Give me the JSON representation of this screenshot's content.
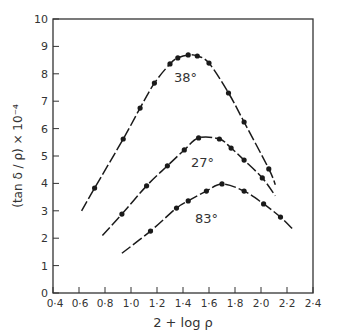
{
  "chart_data": {
    "type": "line",
    "title": "",
    "xlabel": "2 + log ρ",
    "ylabel": "(tan δ / ρ) × 10⁻⁴",
    "xlim": [
      0.4,
      2.4
    ],
    "ylim": [
      0,
      10
    ],
    "grid": false,
    "legend": "none (curves labeled inline)",
    "x_ticks": [
      "0·4",
      "0·6",
      "0·8",
      "1·0",
      "1·2",
      "1·4",
      "1·6",
      "1·8",
      "2·0",
      "2·2",
      "2·4"
    ],
    "y_ticks": [
      "0",
      "1",
      "2",
      "3",
      "4",
      "5",
      "6",
      "7",
      "8",
      "9",
      "10"
    ],
    "series": [
      {
        "name": "38°",
        "label_pos": [
          1.42,
          7.7
        ],
        "line_start": [
          0.62,
          3.0
        ],
        "line_end": [
          2.11,
          3.95
        ],
        "points": [
          [
            0.72,
            3.83
          ],
          [
            0.94,
            5.62
          ],
          [
            1.07,
            6.75
          ],
          [
            1.18,
            7.66
          ],
          [
            1.3,
            8.36
          ],
          [
            1.36,
            8.58
          ],
          [
            1.44,
            8.69
          ],
          [
            1.51,
            8.65
          ],
          [
            1.6,
            8.39
          ],
          [
            1.75,
            7.3
          ],
          [
            1.87,
            6.24
          ],
          [
            2.06,
            4.53
          ]
        ]
      },
      {
        "name": "27°",
        "label_pos": [
          1.55,
          4.6
        ],
        "line_start": [
          0.78,
          2.1
        ],
        "line_end": [
          2.11,
          3.55
        ],
        "points": [
          [
            0.93,
            2.88
          ],
          [
            1.12,
            3.91
          ],
          [
            1.28,
            4.64
          ],
          [
            1.41,
            5.22
          ],
          [
            1.52,
            5.66
          ],
          [
            1.68,
            5.62
          ],
          [
            1.77,
            5.29
          ],
          [
            1.87,
            4.85
          ],
          [
            2.01,
            4.2
          ]
        ]
      },
      {
        "name": "83°",
        "label_pos": [
          1.58,
          2.55
        ],
        "line_start": [
          0.93,
          1.45
        ],
        "line_end": [
          2.25,
          2.3
        ],
        "points": [
          [
            1.15,
            2.26
          ],
          [
            1.35,
            3.1
          ],
          [
            1.44,
            3.36
          ],
          [
            1.58,
            3.72
          ],
          [
            1.7,
            3.98
          ],
          [
            1.87,
            3.72
          ],
          [
            2.02,
            3.25
          ],
          [
            2.15,
            2.77
          ]
        ]
      }
    ]
  },
  "colors": {
    "ink": "#1a1a1a",
    "axis": "#333333",
    "background": "#ffffff"
  }
}
